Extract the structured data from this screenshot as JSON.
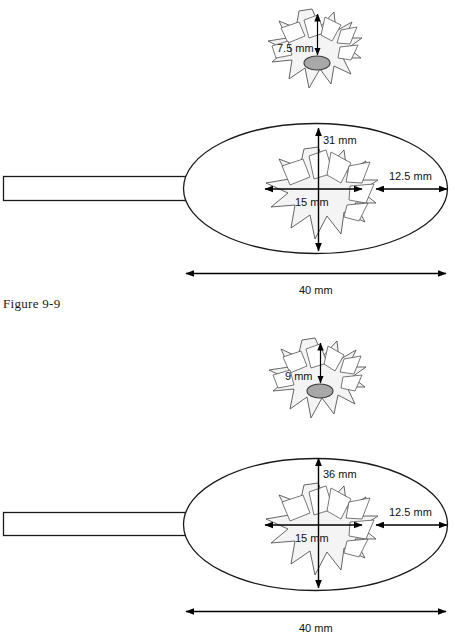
{
  "figure": {
    "caption": "Figure 9-9",
    "units": "mm"
  },
  "panels": [
    {
      "id": "panel-top",
      "detail_burst": {
        "name": "focal-zone-detail-top",
        "depth_label": "7.5 mm",
        "depth_value": 7.5
      },
      "device": {
        "name": "oval-applicator-top",
        "width_label": "40 mm",
        "width_value": 40,
        "height_label": "31 mm",
        "height_value": 31,
        "margin_label": "12.5 mm",
        "margin_value": 12.5,
        "focal_width_label": "15 mm",
        "focal_width_value": 15
      }
    },
    {
      "id": "panel-bottom",
      "detail_burst": {
        "name": "focal-zone-detail-bottom",
        "depth_label": "9 mm",
        "depth_value": 9
      },
      "device": {
        "name": "oval-applicator-bottom",
        "width_label": "40 mm",
        "width_value": 40,
        "height_label": "36 mm",
        "height_value": 36,
        "margin_label": "12.5 mm",
        "margin_value": 12.5,
        "focal_width_label": "15 mm",
        "focal_width_value": 15
      }
    }
  ],
  "colors": {
    "outline": "#1a1a1a",
    "burst_fill": "#f4f4f4",
    "burst_stroke": "#555555",
    "stone_fill": "#a8a8a8",
    "dimension": "#000000",
    "background": "#ffffff"
  }
}
